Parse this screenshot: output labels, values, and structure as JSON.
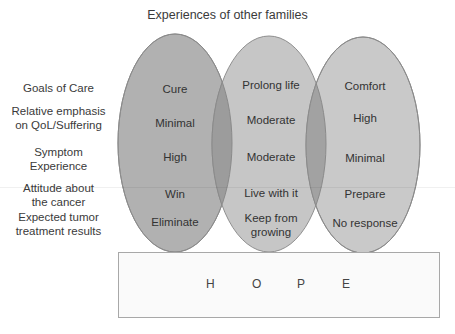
{
  "title": "Experiences of other families",
  "row_labels": [
    {
      "lines": [
        "Goals of Care"
      ]
    },
    {
      "lines": [
        "Relative emphasis",
        "on QoL/Suffering"
      ]
    },
    {
      "lines": [
        "Symptom",
        "Experience"
      ]
    },
    {
      "lines": [
        "Attitude  about",
        "the cancer"
      ]
    },
    {
      "lines": [
        "Expected  tumor",
        "treatment results"
      ]
    }
  ],
  "columns": [
    {
      "name": "cure-family",
      "fill": "#b1b1b1",
      "cells": [
        "Cure",
        "Minimal",
        "High",
        "Win",
        "Eliminate"
      ]
    },
    {
      "name": "prolong-family",
      "fill": "#c6c6c6",
      "cells": [
        "Prolong life",
        "Moderate",
        "Moderate",
        "Live with it",
        "Keep from growing"
      ]
    },
    {
      "name": "comfort-family",
      "fill": "#c9c9c9",
      "cells": [
        "Comfort",
        "High",
        "Minimal",
        "Prepare",
        "No response"
      ]
    }
  ],
  "hope": {
    "letters": [
      "H",
      "O",
      "P",
      "E"
    ]
  },
  "colors": {
    "overlap": "#9c9c9c",
    "outline": "#8a8a8a",
    "box_border": "#a8a8a8"
  }
}
